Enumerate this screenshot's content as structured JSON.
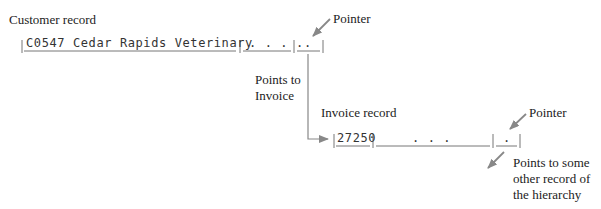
{
  "diagram": {
    "customer_record": {
      "title": "Customer record",
      "fields": [
        "C0547 Cedar Rapids Veterinary",
        ". . . .",
        "."
      ],
      "pointer_label": "Pointer"
    },
    "link_label": [
      "Points to",
      "Invoice"
    ],
    "invoice_record": {
      "title": "Invoice record",
      "fields": [
        "27250",
        ". . .",
        "."
      ],
      "pointer_label": "Pointer"
    },
    "other_link_label": [
      "Points to some",
      "other record of",
      "the hierarchy"
    ],
    "colors": {
      "line": "#888888",
      "arrow": "#888888",
      "text": "#222222"
    }
  }
}
